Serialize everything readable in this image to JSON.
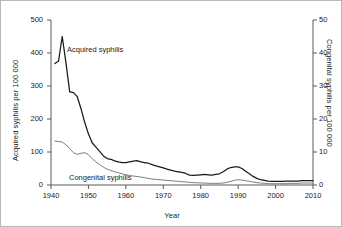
{
  "chart_data": {
    "type": "line",
    "title": "",
    "subtitle": "",
    "xlabel": "Year",
    "ylabel": "Acquired syphilis per 100 000",
    "ylabel_right": "Congenital syphilis per 100 000",
    "xlim": [
      1940,
      2010
    ],
    "ylim": [
      0,
      500
    ],
    "ylim_right": [
      0,
      50
    ],
    "xticks": [
      1940,
      1950,
      1960,
      1970,
      1980,
      1990,
      2000,
      2010
    ],
    "xtick_labels": [
      "1940",
      "1950",
      "1960",
      "1970",
      "1980",
      "1990",
      "2000",
      "2010"
    ],
    "yticks": [
      0,
      100,
      200,
      300,
      400,
      500
    ],
    "ytick_labels": [
      "0",
      "100",
      "200",
      "300",
      "400",
      "500"
    ],
    "yticks_right": [
      0,
      10,
      20,
      30,
      40,
      50
    ],
    "ytick_labels_right": [
      "0",
      "10",
      "20",
      "30",
      "40",
      "50"
    ],
    "grid": false,
    "legend": "inline-annotations",
    "series": [
      {
        "name": "Acquired syphilis",
        "axis": "left",
        "color": "#1a1a1a",
        "units": "per 100 000",
        "label_position": {
          "x": 1945,
          "y": 395
        },
        "x": [
          1941,
          1942,
          1943,
          1944,
          1945,
          1946,
          1947,
          1948,
          1949,
          1950,
          1951,
          1952,
          1953,
          1954,
          1955,
          1956,
          1957,
          1958,
          1959,
          1960,
          1961,
          1962,
          1963,
          1964,
          1965,
          1966,
          1967,
          1968,
          1969,
          1970,
          1971,
          1972,
          1973,
          1974,
          1975,
          1976,
          1977,
          1978,
          1979,
          1980,
          1981,
          1982,
          1983,
          1984,
          1985,
          1986,
          1987,
          1988,
          1989,
          1990,
          1991,
          1992,
          1993,
          1994,
          1995,
          1996,
          1997,
          1998,
          1999,
          2000,
          2001,
          2002,
          2003,
          2004,
          2005,
          2006,
          2007,
          2008,
          2009,
          2010
        ],
        "y": [
          368,
          375,
          450,
          370,
          282,
          280,
          268,
          232,
          190,
          155,
          128,
          115,
          102,
          88,
          80,
          78,
          73,
          70,
          68,
          68,
          70,
          72,
          74,
          70,
          68,
          66,
          62,
          58,
          55,
          52,
          48,
          45,
          42,
          40,
          38,
          35,
          30,
          29,
          30,
          31,
          32,
          31,
          30,
          32,
          34,
          40,
          48,
          53,
          55,
          55,
          50,
          42,
          34,
          26,
          20,
          16,
          14,
          12,
          11,
          11,
          11,
          11,
          12,
          12,
          12,
          12,
          13,
          13,
          13,
          13
        ]
      },
      {
        "name": "Congenital syphilis",
        "axis": "right",
        "color": "#6e6e6e",
        "units": "per 100 000",
        "label_position": {
          "x": 1947,
          "y": 2.2
        },
        "x": [
          1941,
          1942,
          1943,
          1944,
          1945,
          1946,
          1947,
          1948,
          1949,
          1950,
          1951,
          1952,
          1953,
          1954,
          1955,
          1956,
          1957,
          1958,
          1959,
          1960,
          1961,
          1962,
          1963,
          1964,
          1965,
          1966,
          1967,
          1968,
          1969,
          1970,
          1971,
          1972,
          1973,
          1974,
          1975,
          1976,
          1977,
          1978,
          1979,
          1980,
          1981,
          1982,
          1983,
          1984,
          1985,
          1986,
          1987,
          1988,
          1989,
          1990,
          1991,
          1992,
          1993,
          1994,
          1995,
          1996,
          1997,
          1998,
          1999,
          2000,
          2001,
          2002,
          2003,
          2004,
          2005,
          2006,
          2007,
          2008,
          2009,
          2010
        ],
        "y": [
          13.3,
          13.2,
          13.0,
          12.2,
          11.0,
          9.8,
          9.3,
          9.6,
          9.8,
          9.2,
          8.0,
          7.0,
          6.2,
          5.4,
          4.8,
          4.4,
          4.0,
          3.7,
          3.4,
          3.1,
          2.9,
          2.7,
          2.6,
          2.4,
          2.2,
          2.0,
          1.8,
          1.7,
          1.6,
          1.5,
          1.4,
          1.3,
          1.2,
          1.1,
          1.0,
          0.9,
          0.8,
          0.7,
          0.7,
          0.6,
          0.6,
          0.5,
          0.5,
          0.5,
          0.5,
          0.6,
          0.8,
          1.1,
          1.4,
          1.6,
          1.5,
          1.3,
          1.1,
          0.9,
          0.7,
          0.6,
          0.5,
          0.4,
          0.4,
          0.4,
          0.4,
          0.4,
          0.4,
          0.5,
          0.5,
          0.5,
          0.6,
          0.6,
          0.6,
          0.6
        ]
      }
    ]
  },
  "colors": {
    "acquired": "#1a1a1a",
    "congenital": "#6e6e6e",
    "axis": "#5a5a5a",
    "background": "#ffffff"
  }
}
